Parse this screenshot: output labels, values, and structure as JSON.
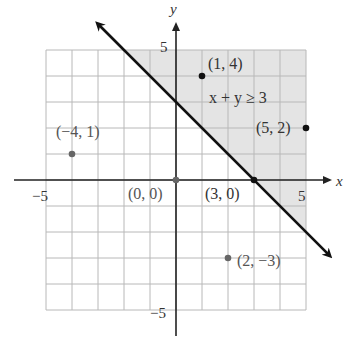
{
  "figure": {
    "type": "inequality-graph",
    "inequality_label": "x + y ≥ 3",
    "boundary_line": {
      "equation": "y = 3 - x",
      "style": "solid",
      "arrows": "both"
    },
    "shaded_region": "x + y >= 3",
    "axes": {
      "x_label": "x",
      "y_label": "y",
      "x_range": [
        -5,
        5
      ],
      "y_range": [
        -5,
        5
      ],
      "grid_step": 1,
      "tick_labels": {
        "x_neg": "−5",
        "x_pos": "5",
        "y_pos": "5",
        "y_neg": "−5"
      }
    },
    "points": [
      {
        "x": 1,
        "y": 4,
        "label": "(1, 4)",
        "in_region": true
      },
      {
        "x": 5,
        "y": 2,
        "label": "(5, 2)",
        "in_region": true
      },
      {
        "x": -4,
        "y": 1,
        "label": "(−4, 1)",
        "in_region": false
      },
      {
        "x": 0,
        "y": 0,
        "label": "(0, 0)",
        "in_region": false
      },
      {
        "x": 3,
        "y": 0,
        "label": "(3, 0)",
        "in_region": true
      },
      {
        "x": 2,
        "y": -3,
        "label": "(2, −3)",
        "in_region": false
      }
    ],
    "colors": {
      "shade": "#e4e4e4",
      "grid": "#b8b8b8",
      "line": "#111111",
      "point_dark": "#111111",
      "point_grey": "#666666"
    }
  },
  "chart_data": {
    "type": "scatter",
    "title": "x + y ≥ 3",
    "xlabel": "x",
    "ylabel": "y",
    "xlim": [
      -5,
      5
    ],
    "ylim": [
      -5,
      5
    ],
    "grid": true,
    "series": [
      {
        "name": "boundary y = 3 − x",
        "kind": "line",
        "x": [
          -5,
          5
        ],
        "y": [
          8,
          -2
        ]
      },
      {
        "name": "test points",
        "kind": "points",
        "x": [
          1,
          5,
          -4,
          0,
          3,
          2
        ],
        "y": [
          4,
          2,
          1,
          0,
          0,
          -3
        ],
        "labels": [
          "(1, 4)",
          "(5, 2)",
          "(−4, 1)",
          "(0, 0)",
          "(3, 0)",
          "(2, −3)"
        ]
      }
    ]
  }
}
